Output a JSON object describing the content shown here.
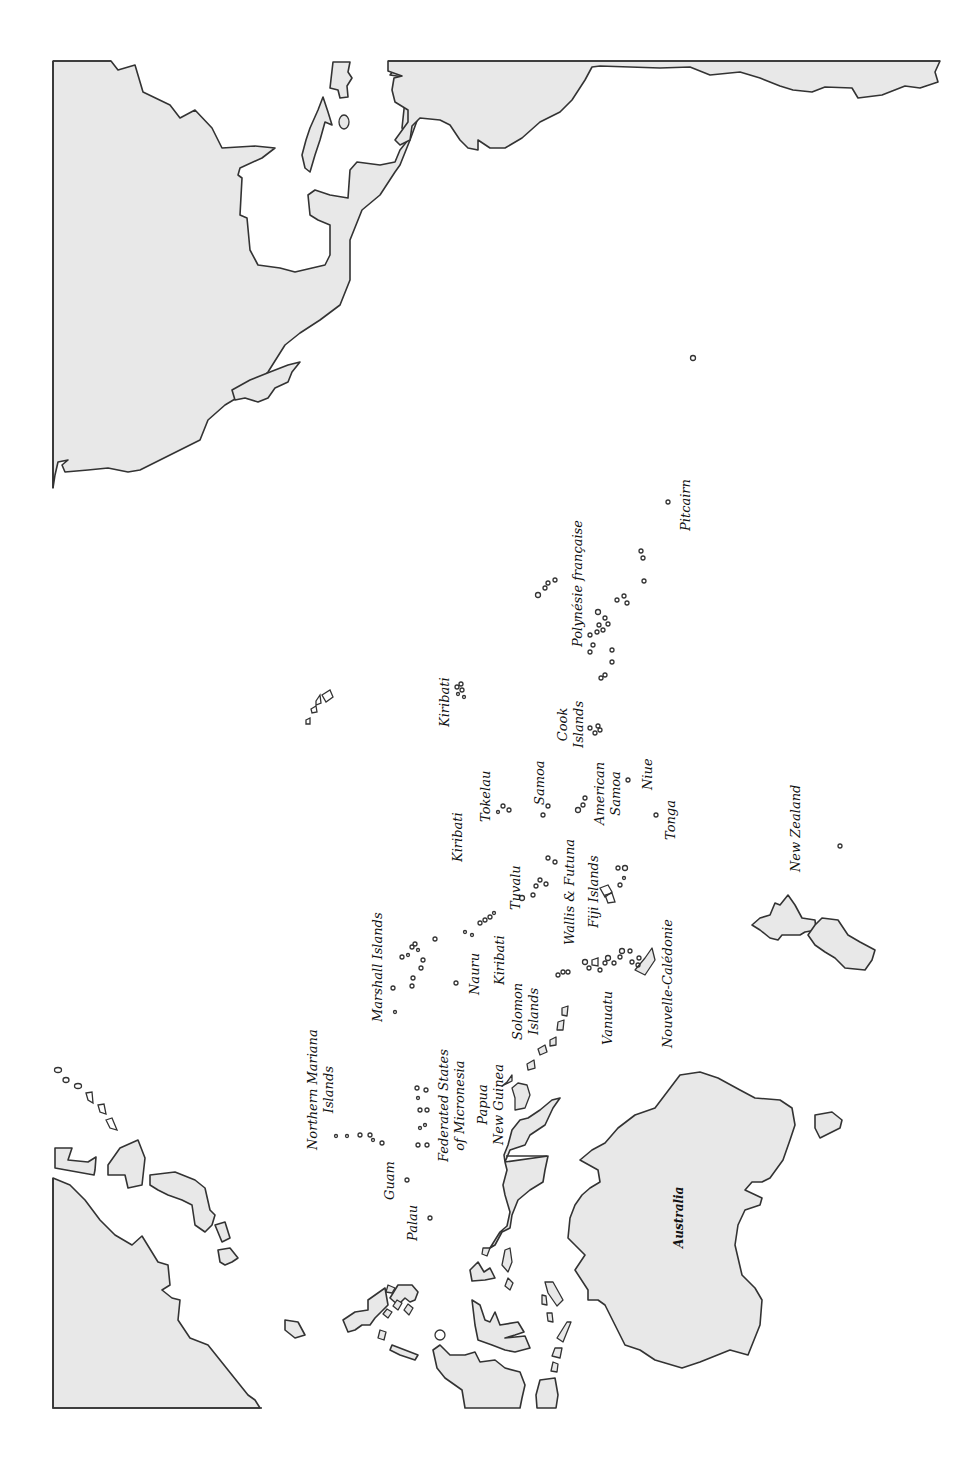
{
  "map": {
    "title": "Pacific Islands region map (rotated)",
    "orientation": "rotated 90° counter-clockwise; north points right",
    "colors": {
      "land": "#e8e8e8",
      "outline": "#333333",
      "ocean": "#ffffff",
      "label": "#111111"
    },
    "labels": {
      "northern_mariana_1": "Northern Mariana",
      "northern_mariana_2": "Islands",
      "guam": "Guam",
      "palau": "Palau",
      "fsm_1": "Federated States",
      "fsm_2": "of Micronesia",
      "png_1": "Papua",
      "png_2": "New Guinea",
      "marshall": "Marshall Islands",
      "nauru": "Nauru",
      "kiribati_west": "Kiribati",
      "kiribati_central": "Kiribati",
      "kiribati_east": "Kiribati",
      "solomon_1": "Solomon",
      "solomon_2": "Islands",
      "tuvalu": "Tuvalu",
      "tokelau": "Tokelau",
      "wallis_futuna": "Wallis & Futuna",
      "fiji": "Fiji Islands",
      "vanuatu": "Vanuatu",
      "nouvelle_caledonie": "Nouvelle-Calédonie",
      "samoa": "Samoa",
      "american_samoa_1": "American",
      "american_samoa_2": "Samoa",
      "niue": "Niue",
      "tonga": "Tonga",
      "cook_1": "Cook",
      "cook_2": "Islands",
      "polynesie": "Polynésie française",
      "pitcairn": "Pitcairn",
      "new_zealand": "New Zealand",
      "australia": "Australia"
    }
  }
}
